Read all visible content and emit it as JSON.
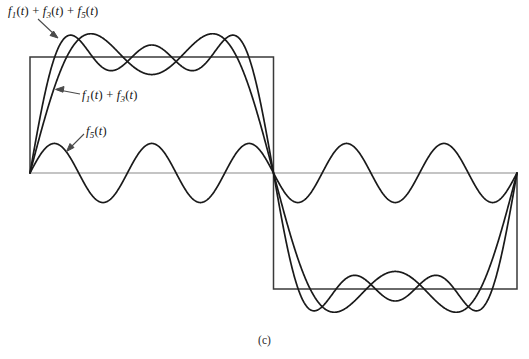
{
  "figure": {
    "caption": "(c)",
    "background_color": "#ffffff",
    "labels": [
      {
        "id": "sum135",
        "text": "f1(t) + f3(t) + f5(t)",
        "parts": [
          "f",
          "1",
          "(t) + ",
          "f",
          "3",
          "(t) + ",
          "f",
          "5",
          "(t)"
        ],
        "x": 8,
        "y": 4
      },
      {
        "id": "sum13",
        "text": "f1(t) + f3(t)",
        "parts": [
          "f",
          "1",
          "(t) + ",
          "f",
          "3",
          "(t)"
        ],
        "x": 82,
        "y": 88
      },
      {
        "id": "f5",
        "text": "f5(t)",
        "parts": [
          "f",
          "5",
          "(t)"
        ],
        "x": 86,
        "y": 124
      }
    ],
    "colors": {
      "curve": "#1a1a1a",
      "square_wave": "#3a3a3a",
      "axis": "#8a8a8a",
      "leader": "#5a5a5a",
      "text": "#141414"
    },
    "geometry": {
      "x_left": 30,
      "x_mid": 273,
      "x_right": 517,
      "y_zero": 173,
      "y_top": 57,
      "y_bottom": 290,
      "square_amplitude": 116
    }
  },
  "chart_data": {
    "type": "line",
    "title": "",
    "subtitle": "",
    "xlabel": "",
    "ylabel": "",
    "grid": false,
    "legend_position": "inline-annotations",
    "axis_ranges": {
      "x": [
        0,
        2
      ],
      "y": [
        -1.35,
        1.35
      ]
    },
    "reference_waveform": {
      "name": "square wave",
      "period": 2,
      "amplitude": 1.0,
      "segments": [
        {
          "x_start": 0,
          "x_end": 1,
          "y": 1.0
        },
        {
          "x_start": 1,
          "x_end": 2,
          "y": -1.0
        }
      ]
    },
    "series": [
      {
        "name": "f1(t) + f3(t) + f5(t)",
        "harmonics": [
          1,
          3,
          5
        ],
        "coefficients": [
          1.0,
          0.3333333,
          0.2
        ],
        "formula": "sin(pi t) + sin(3 pi t)/3 + sin(5 pi t)/5",
        "scale": 1.2732,
        "peak_overshoot": 1.1,
        "annotation": "f1(t) + f3(t) + f5(t)"
      },
      {
        "name": "f1(t) + f3(t)",
        "harmonics": [
          1,
          3
        ],
        "coefficients": [
          1.0,
          0.3333333
        ],
        "formula": "sin(pi t) + sin(3 pi t)/3",
        "scale": 1.2732,
        "peak_overshoot": 1.05,
        "annotation": "f1(t) + f3(t)"
      },
      {
        "name": "f5(t)",
        "harmonics": [
          5
        ],
        "coefficients": [
          0.2
        ],
        "formula": "sin(5 pi t)/5",
        "scale": 1.2732,
        "peak_overshoot": 0.2546,
        "annotation": "f5(t)"
      }
    ],
    "annotations": [
      {
        "text": "f1(t) + f3(t) + f5(t)",
        "points_to": "overshoot peak of 3-term sum"
      },
      {
        "text": "f1(t) + f3(t)",
        "points_to": "rising edge of 2-term sum"
      },
      {
        "text": "f5(t)",
        "points_to": "first crest of fifth harmonic"
      }
    ]
  }
}
